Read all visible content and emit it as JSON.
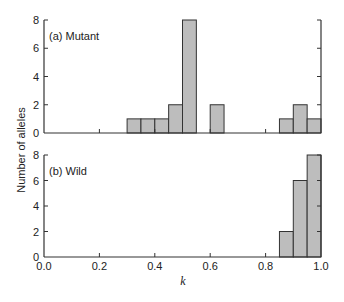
{
  "chart_data": [
    {
      "type": "bar",
      "subtype": "histogram",
      "title": "(a) Mutant",
      "xlabel": "k",
      "ylabel": "Number of alleles",
      "xlim": [
        0.0,
        1.0
      ],
      "ylim": [
        0,
        8
      ],
      "bin_width": 0.05,
      "bins": [
        {
          "x0": 0.3,
          "x1": 0.35,
          "count": 1
        },
        {
          "x0": 0.35,
          "x1": 0.4,
          "count": 1
        },
        {
          "x0": 0.4,
          "x1": 0.45,
          "count": 1
        },
        {
          "x0": 0.45,
          "x1": 0.5,
          "count": 2
        },
        {
          "x0": 0.5,
          "x1": 0.55,
          "count": 8
        },
        {
          "x0": 0.6,
          "x1": 0.65,
          "count": 2
        },
        {
          "x0": 0.85,
          "x1": 0.9,
          "count": 1
        },
        {
          "x0": 0.9,
          "x1": 0.95,
          "count": 2
        },
        {
          "x0": 0.95,
          "x1": 1.0,
          "count": 1
        }
      ],
      "y_ticks": [
        "0",
        "2",
        "4",
        "6",
        "8"
      ],
      "x_ticks": [
        "0.0",
        "0.2",
        "0.4",
        "0.6",
        "0.8",
        "1.0"
      ],
      "grid": false
    },
    {
      "type": "bar",
      "subtype": "histogram",
      "title": "(b) Wild",
      "xlabel": "k",
      "ylabel": "Number of alleles",
      "xlim": [
        0.0,
        1.0
      ],
      "ylim": [
        0,
        8
      ],
      "bin_width": 0.05,
      "bins": [
        {
          "x0": 0.85,
          "x1": 0.9,
          "count": 2
        },
        {
          "x0": 0.9,
          "x1": 0.95,
          "count": 6
        },
        {
          "x0": 0.95,
          "x1": 1.0,
          "count": 8
        }
      ],
      "y_ticks": [
        "0",
        "2",
        "4",
        "6",
        "8"
      ],
      "x_ticks": [
        "0.0",
        "0.2",
        "0.4",
        "0.6",
        "0.8",
        "1.0"
      ],
      "grid": false
    }
  ],
  "labels": {
    "panel_a": "(a) Mutant",
    "panel_b": "(b) Wild",
    "ylabel": "Number of alleles",
    "xlabel": "k"
  },
  "colors": {
    "bar_fill": "#bdbdbd",
    "bar_edge": "#333333",
    "axis": "#333333"
  }
}
